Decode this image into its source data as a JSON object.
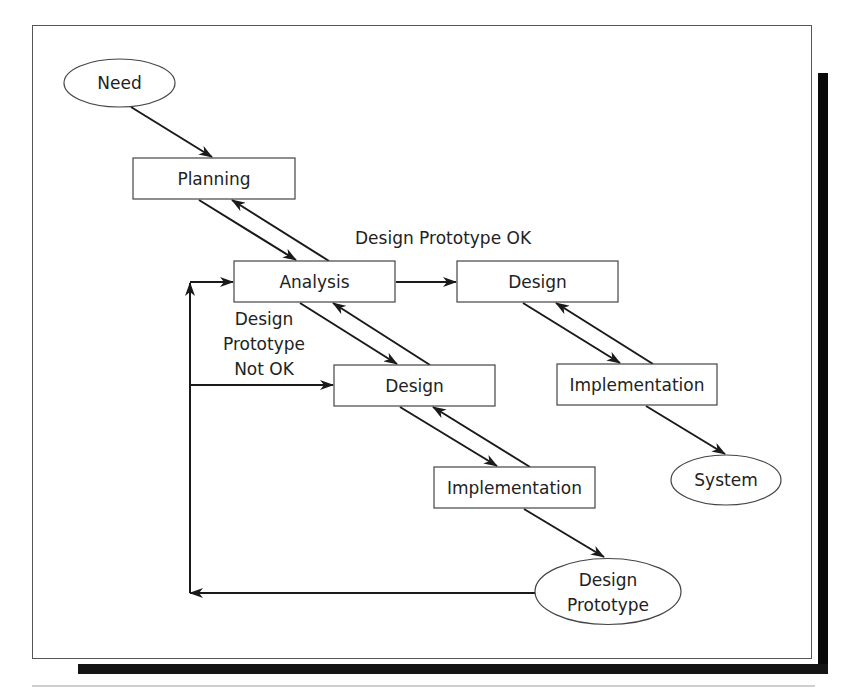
{
  "diagram": {
    "type": "flowchart",
    "title": "",
    "nodes": {
      "need": {
        "label": "Need",
        "shape": "ellipse"
      },
      "planning": {
        "label": "Planning",
        "shape": "rect"
      },
      "analysis": {
        "label": "Analysis",
        "shape": "rect"
      },
      "design_final": {
        "label": "Design",
        "shape": "rect"
      },
      "design_proto": {
        "label": "Design",
        "shape": "rect"
      },
      "implementation_final": {
        "label": "Implementation",
        "shape": "rect"
      },
      "implementation_proto": {
        "label": "Implementation",
        "shape": "rect"
      },
      "system": {
        "label": "System",
        "shape": "ellipse"
      },
      "design_prototype": {
        "label_line1": "Design",
        "label_line2": "Prototype",
        "shape": "ellipse"
      }
    },
    "edge_labels": {
      "proto_ok": "Design Prototype OK",
      "proto_not_ok_line1": "Design",
      "proto_not_ok_line2": "Prototype",
      "proto_not_ok_line3": "Not OK"
    },
    "edges": [
      {
        "from": "Need",
        "to": "Planning"
      },
      {
        "from": "Planning",
        "to": "Analysis"
      },
      {
        "from": "Analysis",
        "to": "Planning"
      },
      {
        "from": "Analysis",
        "to": "Design (final)",
        "label": "Design Prototype OK"
      },
      {
        "from": "Analysis",
        "to": "Design (prototype)"
      },
      {
        "from": "Design (prototype)",
        "to": "Analysis"
      },
      {
        "from": "Design (prototype)",
        "to": "Implementation (prototype)"
      },
      {
        "from": "Implementation (prototype)",
        "to": "Design (prototype)"
      },
      {
        "from": "Implementation (prototype)",
        "to": "Design Prototype"
      },
      {
        "from": "Design Prototype",
        "to": "Analysis",
        "label": "loop back"
      },
      {
        "from": "Design Prototype",
        "to": "Design (prototype)",
        "label": "Design Prototype Not OK"
      },
      {
        "from": "Design (final)",
        "to": "Implementation (final)"
      },
      {
        "from": "Implementation (final)",
        "to": "Design (final)"
      },
      {
        "from": "Implementation (final)",
        "to": "System"
      }
    ],
    "colors": {
      "line": "#1a1a1a",
      "node_border": "#444444",
      "shadow": "#0a0a0a",
      "background": "#ffffff"
    }
  }
}
